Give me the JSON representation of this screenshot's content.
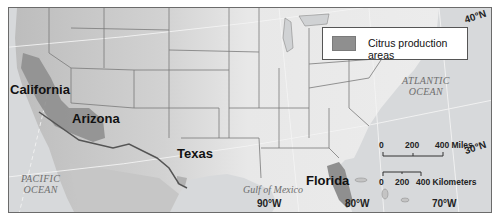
{
  "map": {
    "legend": {
      "swatch_color": "#8f8f8f",
      "label": "Citrus production areas"
    },
    "states": [
      {
        "name": "California"
      },
      {
        "name": "Arizona"
      },
      {
        "name": "Texas"
      },
      {
        "name": "Florida"
      }
    ],
    "water_bodies": {
      "pacific_line1": "PACIFIC",
      "pacific_line2": "OCEAN",
      "atlantic_line1": "ATLANTIC",
      "atlantic_line2": "OCEAN",
      "gulf": "Gulf of Mexico"
    },
    "coordinates": {
      "lat_40": "40°N",
      "lat_30": "30°N",
      "lon_90": "90°W",
      "lon_80": "80°W",
      "lon_70": "70°W"
    },
    "scale_bar": {
      "miles": {
        "ticks": [
          "0",
          "200",
          "400 Miles"
        ]
      },
      "kilometers": {
        "ticks": [
          "0",
          "200",
          "400 Kilometers"
        ]
      }
    },
    "colors": {
      "land": "#e6e6e6",
      "water": "#d6d8da",
      "citrus": "#8f8f8f",
      "borders": "#7a7a7a",
      "frame": "#6b6b6b"
    }
  }
}
